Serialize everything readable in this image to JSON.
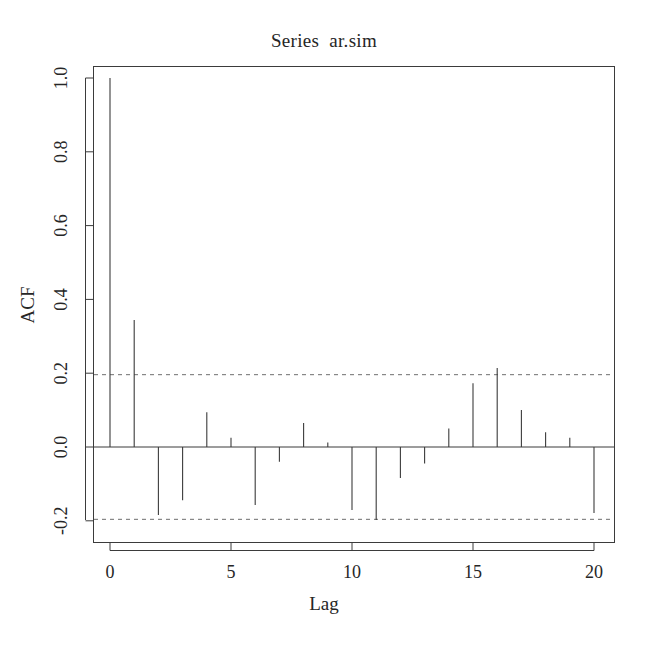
{
  "chart_data": {
    "type": "bar",
    "title": "Series  ar.sim",
    "subtitle": "",
    "xlabel": "Lag",
    "ylabel": "ACF",
    "grid": false,
    "legend": null,
    "xlim": [
      -0.4,
      20.4
    ],
    "ylim": [
      -0.28,
      1.03
    ],
    "xticks": [
      0,
      5,
      10,
      15,
      20
    ],
    "xticklabels": [
      "0",
      "5",
      "10",
      "15",
      "20"
    ],
    "yticks": [
      -0.2,
      0.0,
      0.2,
      0.4,
      0.6,
      0.8,
      1.0
    ],
    "yticklabels": [
      "-0.2",
      "0.0",
      "0.2",
      "0.4",
      "0.6",
      "0.8",
      "1.0"
    ],
    "categories": [
      0,
      1,
      2,
      3,
      4,
      5,
      6,
      7,
      8,
      9,
      10,
      11,
      12,
      13,
      14,
      15,
      16,
      17,
      18,
      19,
      20
    ],
    "values": [
      1.0,
      0.344,
      -0.184,
      -0.144,
      0.094,
      0.025,
      -0.157,
      -0.04,
      0.065,
      0.012,
      -0.171,
      -0.198,
      -0.084,
      -0.045,
      0.05,
      0.173,
      0.214,
      0.1,
      0.04,
      0.025,
      -0.179
    ],
    "confidence_bands": [
      0.196,
      -0.196
    ],
    "confidence_line_style": "dashed",
    "zero_line": 0.0,
    "series_color": "#3b3b3b",
    "band_color": "#6e6e6e",
    "axis_color": "#3b3b3b"
  },
  "annotations": {
    "band_note": ""
  }
}
